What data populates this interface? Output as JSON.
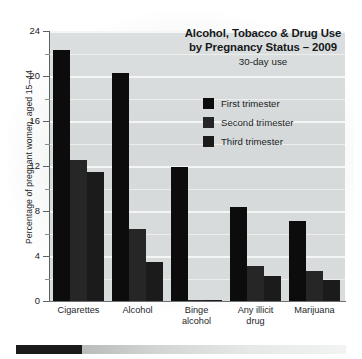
{
  "chart_data": {
    "type": "bar",
    "title": "Alcohol, Tobacco & Drug Use by Pregnancy Status – 2009",
    "title_lines": [
      "Alcohol, Tobacco & Drug Use",
      "by Pregnancy Status – 2009"
    ],
    "subtitle": "30-day use",
    "xlabel": "",
    "ylabel": "Percentage of pregnant women, aged 15–44",
    "ylim": [
      0,
      24
    ],
    "ytick_labels": [
      "0",
      "4",
      "8",
      "12",
      "16",
      "20",
      "24"
    ],
    "ytick_values": [
      0,
      4,
      8,
      12,
      16,
      20,
      24
    ],
    "minor_tick_values": [
      2,
      6,
      10,
      14,
      18,
      22
    ],
    "grid": true,
    "grid_color": "#f4f6f6",
    "plot_background": "#d9dcdc",
    "legend_position": "upper right",
    "categories": [
      "Cigarettes",
      "Alcohol",
      "Binge alcohol",
      "Any illicit drug",
      "Marijuana"
    ],
    "category_label_lines": [
      [
        "Cigarettes"
      ],
      [
        "Alcohol"
      ],
      [
        "Binge",
        "alcohol"
      ],
      [
        "Any illicit",
        "drug"
      ],
      [
        "Marijuana"
      ]
    ],
    "series": [
      {
        "name": "First trimester",
        "color": "#0c0c0c",
        "values": [
          22.3,
          20.3,
          11.9,
          8.4,
          7.1
        ]
      },
      {
        "name": "Second trimester",
        "color": "#262626",
        "values": [
          12.5,
          6.4,
          0.1,
          3.1,
          2.7
        ]
      },
      {
        "name": "Third trimester",
        "color": "#1b1b1b",
        "values": [
          11.5,
          3.5,
          0.1,
          2.2,
          1.9
        ]
      }
    ]
  },
  "footer": {
    "bar_label": ""
  }
}
